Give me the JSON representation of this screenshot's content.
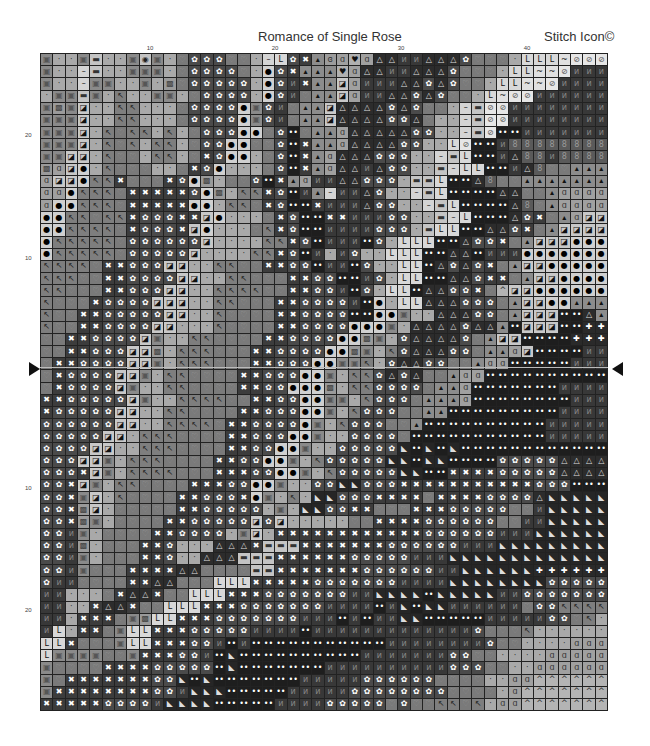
{
  "header": {
    "title": "Romance of Single Rose",
    "brand": "Stitch Icon©"
  },
  "column_labels": [
    {
      "text": "10",
      "x": 150
    },
    {
      "text": "20",
      "x": 275
    },
    {
      "text": "30",
      "x": 401
    },
    {
      "text": "40",
      "x": 527
    }
  ],
  "row_labels": [
    {
      "text": "20",
      "y": 135
    },
    {
      "text": "10",
      "y": 258
    },
    {
      "text": "10",
      "y": 488
    },
    {
      "text": "20",
      "y": 610
    }
  ],
  "center_markers": {
    "left": "▶",
    "right": "◀"
  },
  "legend": {
    "s": {
      "glyph": "▣",
      "bg": "#8a8a8a",
      "fg": "#555"
    },
    "d": {
      "glyph": "·",
      "bg": "#a9a9a9",
      "fg": "#333"
    },
    "-": {
      "glyph": "–",
      "bg": "#d4d4d4",
      "fg": "#222"
    },
    "E": {
      "glyph": "▬",
      "bg": "#c4c4c4",
      "fg": "#333"
    },
    "h": {
      "glyph": "♡",
      "bg": "#7a7a7a",
      "fg": "#999"
    },
    "p": {
      "glyph": "↖",
      "bg": "#7e7e7e",
      "fg": "#222"
    },
    "x": {
      "glyph": "✖",
      "bg": "#3c3c3c",
      "fg": "#fff"
    },
    "f": {
      "glyph": "✿",
      "bg": "#4a4a4a",
      "fg": "#fff"
    },
    "o": {
      "glyph": "●",
      "bg": "#d0d0d0",
      "fg": "#000"
    },
    "b": {
      "glyph": "◪",
      "bg": "#c8c8c8",
      "fg": "#111"
    },
    "L": {
      "glyph": "L",
      "bg": "#d8d8d8",
      "fg": "#111"
    },
    "~": {
      "glyph": "~",
      "bg": "#e0e0e0",
      "fg": "#111"
    },
    "/": {
      "glyph": "⊘",
      "bg": "#e6e6e6",
      "fg": "#555"
    },
    "n": {
      "glyph": "ᴎ",
      "bg": "#383838",
      "fg": "#888"
    },
    ":": {
      "glyph": "••",
      "bg": "#1e1e1e",
      "fg": "#fff"
    },
    "a": {
      "glyph": "△",
      "bg": "#2c2c2c",
      "fg": "#ddd"
    },
    "t": {
      "glyph": "▴",
      "bg": "#8c8c8c",
      "fg": "#111"
    },
    "g": {
      "glyph": "ɑ",
      "bg": "#a0a0a0",
      "fg": "#333"
    },
    "k": {
      "glyph": "♥",
      "bg": "#b0b0b0",
      "fg": "#111"
    },
    "q": {
      "glyph": "▩",
      "bg": "#9a9a9a",
      "fg": "#444"
    },
    "c": {
      "glyph": "◉",
      "bg": "#c4c4c4",
      "fg": "#222"
    },
    "B": {
      "glyph": "8",
      "bg": "#5a5a5a",
      "fg": "#999"
    },
    "^": {
      "glyph": "^",
      "bg": "#b4b4b4",
      "fg": "#333"
    },
    "+": {
      "glyph": "✚",
      "bg": "#2a2a2a",
      "fg": "#fff"
    },
    "N": {
      "glyph": "◣",
      "bg": "#262626",
      "fg": "#ddd"
    },
    "e": {
      "glyph": "ɞ",
      "bg": "#9c9c9c",
      "fg": "#333"
    }
  },
  "grid": {
    "columns": 46,
    "rows": [
      "sddsEddscsdhfffhhd-LfxtegkgaannaaafhhhdLLL~//",
      "sdd-EddsssdhffffhdofxtttkgaannaaafhhhdLL~~/n",
      "sdd-SsddsdqhfffffdofnxttbgnnnaafafhhdLL~~/nnn",
      "dssEsdpddssdhffffdofnhttbgnnaafafhhdL~//nnnn",
      "sqsbddppdddhffffosfnhttbaaaafafhhd-E//nnnnn",
      "sssbddppdddhffffosfnhttbaaaaffahdd-E//nnnnnn",
      "sssbdphppdpdhfffoohf:httgaaaaaffdd-E/::nnnnn",
      "sssbdphpdppdhffoohhf:xttgaaaaffddL/::nBBBB",
      "ssbbdphhdppdhxfoodhf:xtgaaafffdd-EL::naBBnB",
      "qgbodphhhddhxfodddhf:xtgaanaffddE-LL::naBhht",
      "gbboppxhhhxfoqdhhf:xtgnnaafffdEEL::aBhhtt",
      "ggoppphxxxxxfoqdppxf:nt-nnafdd-EL::::aahhtg",
      "gooppphxxxxxoodpphxf::xnnnaffdd-EL::::aBhtgg",
      "oopphppxfffxxbodddhxf::xxnnnffddE-L:::afxhtgbb",
      "oopppphxfffxbodddhpxf::nnnnfffdELL::aafxhtbbb",
      "oppppphffffffbddddppxf:nnn:fdLLL::affxhtbbbo",
      "oppppphfffffbddddppxf:ndnfddLLL::aa:nnnoo",
      "pppphxxfffbbddpphhxxff:nn:fddLL:afafxhtbbooo",
      "ppphhxxffffbbddpphhhxxff::nfdLL::aafxxhtbboo",
      "pphhhxxfffbbddpppphhxxffn:fdLL:aaffxh^bbooo",
      "phhhxffffbbbddpphhhxxffffn:odLLaaafffhtbboot",
      "phhxxfffffbbddphhhhxxffff::oosddaaaffhtbbb::at",
      "phhxxffffbbdddphhhhxxffffooosdaaaafaat:bbb::+",
      "hhxxffffbsddpphhhhxxffffooqsdfaaaafhtbb::::+",
      "hhxxfffbbqdppphhhxxffffooqsdpfaaaffhttgb::::n",
      "hxxffffbbsdppphhhxxfffoosspdfaaffhhtgg:::::n",
      "hxffffbbsdpphhhhxxfffoosdppfafahhtgg::::::",
      "hxffffbsddpphhhhxxffoooqdppffffhttg:::::::n",
      "xxfffffbsddpppphhxxffoossdpfffhtttg::::::::n",
      "xfffffbbddpphhhhxxfffoosdpfffhhtt:::::::::n",
      "ffffffbbddpppphxxffffosdpfffhht::::::::::nn",
      "fffffbbdppphhhhxxfffoosddffffh:::::::::::n",
      "ffffbbddppphhhhxxffoosddfffffN:N:N:::::::::",
      "fffbbsdppphhhhxxffoosdpfffffNN:NN::::fffffaa",
      "fffxbsdpppphhhxxxffoosdpfffffNN::xxxxfffffaa",
      "ffxbsdpphhhhxxxffoosddffNNfffxxxxxxxxxxxfff:",
      "ffxsbdphhhhxxfffxosdpdNNfffxxxxhxxxxffffaN",
      "ffxqbdhhhhhxxfffffdsdNNffxxhhhxxxfffffhhnNN",
      "ffxqsdhhhhxxfffffbfbdddddhhxxxxffffffhhnnNN",
      "ffnsdhhhhxxffffdsbdxxxxxxxxxxxxffffffnnnNNN",
      "ffnqdhhhxxfdddaaaxEEExxxxxxxffffffnnnNNNN",
      "ffnsdhhhxxfddaaaEEExxxxxxfffffnnnNNNNNNN",
      "ffnshhhxxxxaahhhhEExxxxxxxffffffnnNNNNNN+",
      "fnnhhhhxxaahhhLLLxxxxxfffffffnnnnNNNNNNNNf",
      "nndddhxaaxhhLLLxxxfffffffnnNNNN:NNNNNnnff",
      "nnddxaaxhhLLLxxxfffffffnnnn:nN:NNnnnnnnhffp",
      "nndxxxhsqLLxxxfffffffnnn:n:nnNN:::::nnnnnffhpd",
      "nLdxxhsLLxxxfffffnnnn:nnnnnnnnnnnnnfhhhpdd",
      "LLxhhhsLLxxxffn:n:::::::::::nnnnnnnnfhhddddg",
      "Lsssshhsxxxffn:N::::::::::nnnnnnnffhhddddgg",
      "shhhhxxxxfffff:N:::::::nnnnnnnnnnfffhhddggg",
      "shxxxxxxxffN:N:::::::nnnnnffffffhhhhddgg^^",
      "sxxxxxxxxffnNNN:::::nnnnnffffffffhhhhdg^^^",
      "xxxxxffffnNNNN:::::nnnnfffffhfhhpphpdgg^^^"
    ]
  }
}
